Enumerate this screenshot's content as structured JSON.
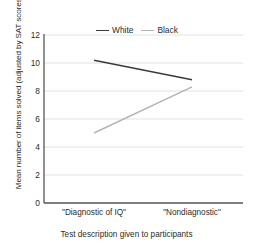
{
  "chart_data": {
    "type": "line",
    "title": "",
    "xlabel": "Test description given to participants",
    "ylabel": "Mean number of items solved (adjusted by SAT scores)",
    "categories": [
      "\"Diagnostic of IQ\"",
      "\"Nondiagnostic\""
    ],
    "ylim": [
      0,
      12
    ],
    "yticks": [
      0,
      2,
      4,
      6,
      8,
      10,
      12
    ],
    "ytick_labels": [
      "0",
      "2",
      "4",
      "6",
      "8",
      "10",
      "12"
    ],
    "grid": "horizontal",
    "legend_position": "top-center",
    "series": [
      {
        "name": "White",
        "color": "#3a3a3a",
        "values": [
          10.2,
          8.8
        ]
      },
      {
        "name": "Black",
        "color": "#b4b4b4",
        "values": [
          5.0,
          8.3
        ]
      }
    ]
  },
  "axes": {
    "y_label": "Mean number of items solved (adjusted by SAT scores)",
    "x_label": "Test description given to participants",
    "y_ticks": [
      "0",
      "2",
      "4",
      "6",
      "8",
      "10",
      "12"
    ],
    "x_ticks": [
      "\"Diagnostic of IQ\"",
      "\"Nondiagnostic\""
    ]
  },
  "legend": {
    "items": [
      {
        "label": "White",
        "color": "#3a3a3a"
      },
      {
        "label": "Black",
        "color": "#b4b4b4"
      }
    ]
  },
  "colors": {
    "axis": "#555555",
    "grid": "#e2e2e2",
    "text": "#2b2b2b",
    "series_white": "#3a3a3a",
    "series_black": "#b4b4b4"
  }
}
